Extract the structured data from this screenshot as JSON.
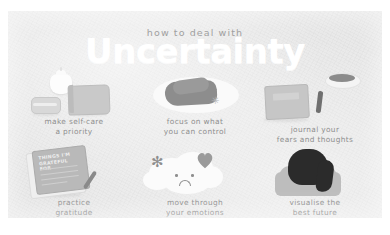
{
  "poster": {
    "kicker": "how to deal with",
    "headline": "Uncertainty",
    "background_color": "#e9e9e9",
    "headline_color": "#ffffff",
    "caption_color": "#8e8e8e"
  },
  "tips": [
    {
      "id": "self-care",
      "caption": "make self-care\na priority",
      "icon": "candle-jar-book-icon"
    },
    {
      "id": "control",
      "caption": "focus on what\nyou can control",
      "icon": "hands-holding-icon"
    },
    {
      "id": "journal",
      "caption": "journal your\nfears and thoughts",
      "icon": "journal-pen-cup-icon"
    },
    {
      "id": "gratitude",
      "caption": "practice\ngratitude",
      "icon": "notepad-pen-icon",
      "notepad_text": "THINGS I'M\nGRATEFUL FOR"
    },
    {
      "id": "emotions",
      "caption": "move through\nyour emotions",
      "icon": "sad-cloud-icon"
    },
    {
      "id": "visualise",
      "caption": "visualise the\nbest future",
      "icon": "person-from-behind-icon"
    }
  ]
}
